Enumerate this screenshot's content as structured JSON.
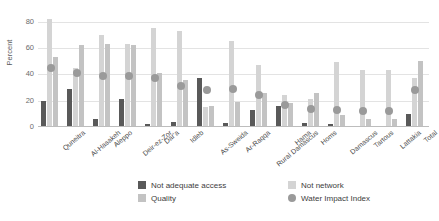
{
  "chart_data": {
    "type": "bar",
    "title": "",
    "xlabel": "",
    "ylabel": "Percent",
    "ylim": [
      0,
      88
    ],
    "yticks": [
      0,
      20,
      40,
      60,
      80
    ],
    "grid": true,
    "legend_position": "bottom",
    "categories": [
      "Quneitra",
      "Al-Hasakeh",
      "Aleppo",
      "Deir-ez-Zor",
      "Dar'a",
      "Idleb",
      "As-Sweida",
      "Ar-Raqqa",
      "Rural Damascus",
      "Hama",
      "Homs",
      "Damascus",
      "Tartous",
      "Lattakia",
      "Total"
    ],
    "series": [
      {
        "name": "Not adequate access",
        "color": "#595959",
        "type": "bar",
        "values": [
          20,
          29,
          6,
          21,
          2,
          4,
          37,
          3,
          13,
          16,
          3,
          2,
          1,
          1,
          10
        ]
      },
      {
        "name": "Not network",
        "color": "#d4d4d4",
        "type": "bar",
        "values": [
          82,
          45,
          70,
          63,
          75,
          73,
          15,
          65,
          47,
          24,
          21,
          49,
          43,
          43,
          37
        ]
      },
      {
        "name": "Quality",
        "color": "#c3c3c3",
        "type": "bar",
        "values": [
          53,
          62,
          63,
          62,
          41,
          36,
          16,
          19,
          26,
          18,
          26,
          9,
          6,
          6,
          50
        ]
      },
      {
        "name": "Water Impact Index",
        "color": "#9a9a9a",
        "type": "scatter",
        "values": [
          45,
          41,
          39,
          39,
          37,
          31,
          28,
          29,
          24,
          17,
          14,
          13,
          12,
          12,
          28
        ]
      }
    ]
  },
  "legend": {
    "items": [
      {
        "label": "Not adequate access",
        "color": "#595959",
        "shape": "square"
      },
      {
        "label": "Not network",
        "color": "#d4d4d4",
        "shape": "square"
      },
      {
        "label": "Quality",
        "color": "#c3c3c3",
        "shape": "square"
      },
      {
        "label": "Water Impact Index",
        "color": "#9a9a9a",
        "shape": "circle"
      }
    ]
  }
}
